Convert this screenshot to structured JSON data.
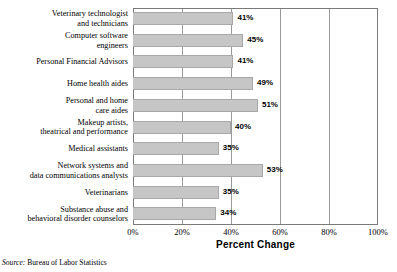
{
  "chart_data": {
    "type": "bar",
    "orientation": "horizontal",
    "title": "",
    "xlabel": "Percent Change",
    "ylabel": "",
    "xlim": [
      0,
      100
    ],
    "xticks": [
      "0%",
      "20%",
      "40%",
      "60%",
      "80%",
      "100%"
    ],
    "xtick_values": [
      0,
      20,
      40,
      60,
      80,
      100
    ],
    "grid": true,
    "legend": "none",
    "bar_color": "#c6c6c6",
    "bar_edge_color": "#a8a8a8",
    "plot_border_color": "#7a7a7a",
    "categories": [
      "Veterinary technologist\nand technicians",
      "Computer software\nengineers",
      "Personal Financial Advisors",
      "Home health aides",
      "Personal and home\ncare aides",
      "Makeup artists,\ntheatrical and performance",
      "Medical assistants",
      "Network systems and\ndata communications analysts",
      "Veterinarians",
      "Substance abuse and\nbehavioral disorder counselors"
    ],
    "values": [
      41,
      45,
      41,
      49,
      51,
      40,
      35,
      53,
      35,
      34
    ],
    "value_labels": [
      "41%",
      "45%",
      "41%",
      "49%",
      "51%",
      "40%",
      "35%",
      "53%",
      "35%",
      "34%"
    ],
    "source_prefix": "Source:",
    "source_text": "Bureau of Labor Statistics"
  }
}
